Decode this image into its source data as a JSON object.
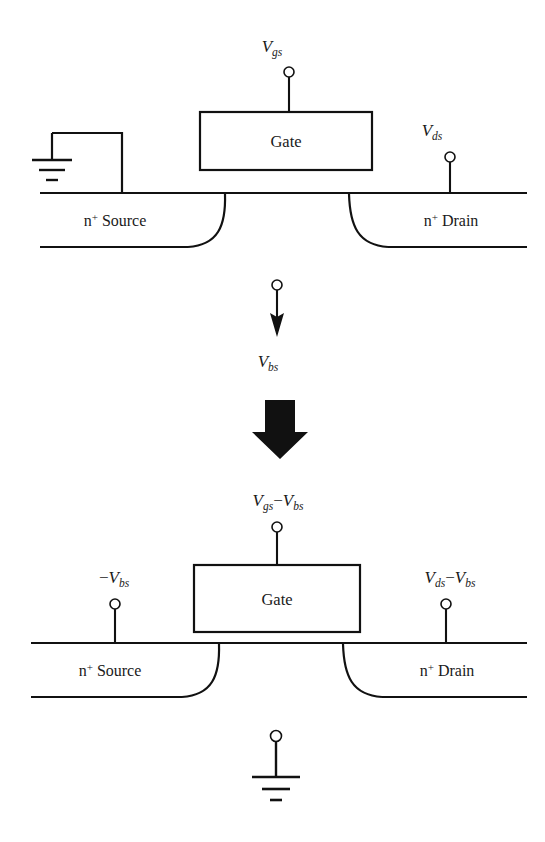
{
  "figure": {
    "kind": "mosfet-bias-reference-transformation",
    "colors": {
      "line": "#111111",
      "text": "#1a1a1a",
      "background": "#ffffff"
    }
  },
  "top_device": {
    "gate_label": "Gate",
    "source_label": {
      "species": "n",
      "charge": "+",
      "role": "Source"
    },
    "drain_label": {
      "species": "n",
      "charge": "+",
      "role": "Drain"
    },
    "gate_terminal": {
      "symbol": "V",
      "subscript": "gs",
      "full": "Vgs"
    },
    "drain_terminal": {
      "symbol": "V",
      "subscript": "ds",
      "full": "Vds"
    },
    "body_terminal": {
      "type": "ground",
      "label": ""
    }
  },
  "transition": {
    "body_arrow_terminal": {
      "symbol": "V",
      "subscript": "bs",
      "full": "Vbs"
    },
    "transform_arrow": "block-arrow-down"
  },
  "bottom_device": {
    "gate_label": "Gate",
    "source_label": {
      "species": "n",
      "charge": "+",
      "role": "Source"
    },
    "drain_label": {
      "species": "n",
      "charge": "+",
      "role": "Drain"
    },
    "gate_terminal": {
      "lead": "V",
      "lead_sub": "gs",
      "operator": "−",
      "trail": "V",
      "trail_sub": "bs",
      "full": "Vgs−Vbs"
    },
    "source_terminal": {
      "operator": "−",
      "symbol": "V",
      "subscript": "bs",
      "full": "−Vbs"
    },
    "drain_terminal": {
      "lead": "V",
      "lead_sub": "ds",
      "operator": "−",
      "trail": "V",
      "trail_sub": "bs",
      "full": "Vds−Vbs"
    },
    "body_terminal": {
      "type": "ground",
      "label": ""
    }
  }
}
